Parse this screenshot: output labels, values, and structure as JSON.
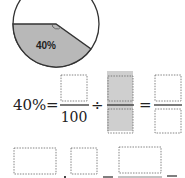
{
  "pie": {
    "label": "40%",
    "shaded_percent": 40,
    "shade_color": "#b8b8b8",
    "outline_color": "#333333"
  },
  "equation": {
    "lhs": "40%",
    "equals": "=",
    "divide": "÷",
    "denominator": "100",
    "highlight_color": "#cfcfcf"
  },
  "bottom_row": {
    "boxes": 3
  }
}
